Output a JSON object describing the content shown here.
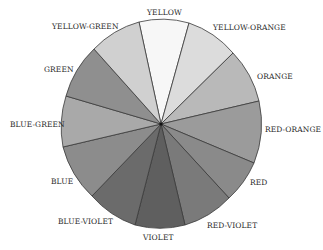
{
  "diagram": {
    "type": "color-wheel",
    "center": [
      161,
      124
    ],
    "radius_x": 100,
    "radius_y": 103,
    "segments": [
      {
        "name": "YELLOW",
        "fill": "#f7f7f7",
        "from": [
          139,
          22
        ],
        "to": [
          189,
          23
        ],
        "label_pos": [
          147,
          8
        ]
      },
      {
        "name": "YELLOW-ORANGE",
        "fill": "#dcdcdc",
        "from": [
          189,
          23
        ],
        "to": [
          233,
          53
        ],
        "label_pos": [
          213,
          23
        ]
      },
      {
        "name": "ORANGE",
        "fill": "#b9b9b9",
        "from": [
          233,
          53
        ],
        "to": [
          259,
          101
        ],
        "label_pos": [
          257,
          72
        ]
      },
      {
        "name": "RED-ORANGE",
        "fill": "#9b9b9b",
        "from": [
          259,
          101
        ],
        "to": [
          254,
          163
        ],
        "label_pos": [
          265,
          125
        ]
      },
      {
        "name": "RED",
        "fill": "#8a8a8a",
        "from": [
          254,
          163
        ],
        "to": [
          229,
          198
        ],
        "label_pos": [
          250,
          178
        ]
      },
      {
        "name": "RED-VIOLET",
        "fill": "#7a7a7a",
        "from": [
          229,
          198
        ],
        "to": [
          185,
          225
        ],
        "label_pos": [
          207,
          221
        ]
      },
      {
        "name": "VIOLET",
        "fill": "#5f5f5f",
        "from": [
          185,
          225
        ],
        "to": [
          135,
          225
        ],
        "label_pos": [
          143,
          233
        ]
      },
      {
        "name": "BLUE-VIOLET",
        "fill": "#6b6b6b",
        "from": [
          135,
          225
        ],
        "to": [
          92,
          196
        ],
        "label_pos": [
          58,
          217
        ]
      },
      {
        "name": "BLUE",
        "fill": "#8c8c8c",
        "from": [
          92,
          196
        ],
        "to": [
          63,
          147
        ],
        "label_pos": [
          51,
          177
        ]
      },
      {
        "name": "BLUE-GREEN",
        "fill": "#a9a9a9",
        "from": [
          63,
          147
        ],
        "to": [
          66,
          96
        ],
        "label_pos": [
          10,
          120
        ]
      },
      {
        "name": "GREEN",
        "fill": "#8f8f8f",
        "from": [
          66,
          96
        ],
        "to": [
          94,
          49
        ],
        "label_pos": [
          44,
          65
        ]
      },
      {
        "name": "YELLOW-GREEN",
        "fill": "#d0d0d0",
        "from": [
          94,
          49
        ],
        "to": [
          139,
          22
        ],
        "label_pos": [
          52,
          22
        ]
      }
    ],
    "stroke_color": "#3a3a3a"
  }
}
